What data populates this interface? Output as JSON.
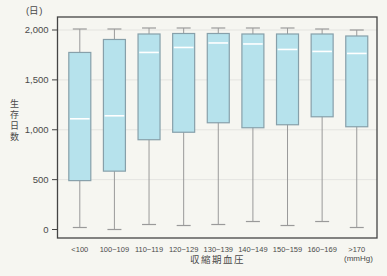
{
  "chart_data": {
    "type": "box",
    "title": "",
    "y_unit": "(日)",
    "x_unit": "(mmHg)",
    "ylabel": "生存日数",
    "xlabel": "収縮期血圧",
    "ylim": [
      0,
      2000
    ],
    "grid": true,
    "legend": "none",
    "y_ticks": [
      {
        "value": 0,
        "label": "0"
      },
      {
        "value": 500,
        "label": "500"
      },
      {
        "value": 1000,
        "label": "1,000"
      },
      {
        "value": 1500,
        "label": "1,500"
      },
      {
        "value": 2000,
        "label": "2,000"
      }
    ],
    "categories": [
      "<100",
      "100~109",
      "110~119",
      "120~129",
      "130~139",
      "140~149",
      "150~159",
      "160~169",
      ">170"
    ],
    "boxes": [
      {
        "category": "<100",
        "low": 20,
        "q1": 490,
        "median": 1110,
        "q3": 1775,
        "high": 2010
      },
      {
        "category": "100~109",
        "low": 0,
        "q1": 585,
        "median": 1140,
        "q3": 1905,
        "high": 2010
      },
      {
        "category": "110~119",
        "low": 50,
        "q1": 900,
        "median": 1775,
        "q3": 1960,
        "high": 2020
      },
      {
        "category": "120~129",
        "low": 40,
        "q1": 975,
        "median": 1825,
        "q3": 1965,
        "high": 2020
      },
      {
        "category": "130~139",
        "low": 50,
        "q1": 1070,
        "median": 1870,
        "q3": 1965,
        "high": 2020
      },
      {
        "category": "140~149",
        "low": 80,
        "q1": 1020,
        "median": 1860,
        "q3": 1960,
        "high": 2020
      },
      {
        "category": "150~159",
        "low": 40,
        "q1": 1050,
        "median": 1805,
        "q3": 1960,
        "high": 2020
      },
      {
        "category": "160~169",
        "low": 80,
        "q1": 1130,
        "median": 1785,
        "q3": 1960,
        "high": 2010
      },
      {
        "category": ">170",
        "low": 20,
        "q1": 1030,
        "median": 1765,
        "q3": 1940,
        "high": 2000
      }
    ],
    "colors": {
      "background": "#f6f6f1",
      "box_fill": "#b6e2ec",
      "box_border": "#87a0aa",
      "median_line": "#ffffff",
      "whisker": "#9a9a9a",
      "grid_line": "#e4e4e0",
      "axis": "#444444",
      "text": "#4a4a4a"
    }
  }
}
